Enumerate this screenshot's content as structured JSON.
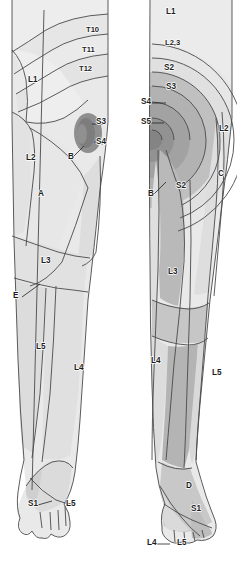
{
  "figure": {
    "views": [
      {
        "id": "left",
        "name": "anterior-medial-lower-limb"
      },
      {
        "id": "right",
        "name": "posterior-lateral-lower-limb"
      }
    ]
  },
  "colors": {
    "background": "#ffffff",
    "outline": "#3a3a3a",
    "skin_lightest": "#efefef",
    "skin_light": "#e4e4e4",
    "skin_mid": "#d2d2d2",
    "skin_mid2": "#c3c3c3",
    "skin_dark": "#b0b0b0",
    "skin_darker": "#9b9b9b",
    "skin_darkest": "#8a8a8a",
    "label_text": "#1d1d1d"
  },
  "left_view": {
    "name": "anterior-medial-lower-limb",
    "labels": [
      {
        "id": "t10",
        "text": "T10",
        "x": 86,
        "y": 32
      },
      {
        "id": "t11",
        "text": "T11",
        "x": 82,
        "y": 52
      },
      {
        "id": "t12",
        "text": "T12",
        "x": 79,
        "y": 71
      },
      {
        "id": "l1",
        "text": "L1",
        "x": 28,
        "y": 82
      },
      {
        "id": "s3",
        "text": "S3",
        "x": 96,
        "y": 124
      },
      {
        "id": "s4",
        "text": "S4",
        "x": 96,
        "y": 144
      },
      {
        "id": "l2",
        "text": "L2",
        "x": 26,
        "y": 160
      },
      {
        "id": "b",
        "text": "B",
        "x": 68,
        "y": 159
      },
      {
        "id": "a",
        "text": "A",
        "x": 38,
        "y": 196
      },
      {
        "id": "l3",
        "text": "L3",
        "x": 41,
        "y": 263
      },
      {
        "id": "e",
        "text": "E",
        "x": 13,
        "y": 298
      },
      {
        "id": "l5",
        "text": "L5",
        "x": 36,
        "y": 349
      },
      {
        "id": "l4",
        "text": "L4",
        "x": 74,
        "y": 370
      },
      {
        "id": "s1",
        "text": "S1",
        "x": 28,
        "y": 506
      },
      {
        "id": "l5b",
        "text": "L5",
        "x": 66,
        "y": 506
      }
    ]
  },
  "right_view": {
    "name": "posterior-lateral-lower-limb",
    "labels": [
      {
        "id": "l1",
        "text": "L1",
        "x": 166,
        "y": 14
      },
      {
        "id": "l23",
        "text": "L2,3",
        "x": 165,
        "y": 45
      },
      {
        "id": "s2",
        "text": "S2",
        "x": 164,
        "y": 70
      },
      {
        "id": "s3",
        "text": "S3",
        "x": 166,
        "y": 89
      },
      {
        "id": "s4",
        "text": "S4",
        "x": 141,
        "y": 104
      },
      {
        "id": "s5",
        "text": "S5",
        "x": 141,
        "y": 124
      },
      {
        "id": "l2",
        "text": "L2",
        "x": 219,
        "y": 131
      },
      {
        "id": "c",
        "text": "C",
        "x": 218,
        "y": 176
      },
      {
        "id": "s2b",
        "text": "S2",
        "x": 176,
        "y": 188
      },
      {
        "id": "b",
        "text": "B",
        "x": 148,
        "y": 196
      },
      {
        "id": "l3",
        "text": "L3",
        "x": 168,
        "y": 274
      },
      {
        "id": "l4",
        "text": "L4",
        "x": 151,
        "y": 363
      },
      {
        "id": "l5",
        "text": "L5",
        "x": 212,
        "y": 375
      },
      {
        "id": "d",
        "text": "D",
        "x": 186,
        "y": 488
      },
      {
        "id": "s1",
        "text": "S1",
        "x": 191,
        "y": 511
      },
      {
        "id": "l4b",
        "text": "L4",
        "x": 147,
        "y": 545
      },
      {
        "id": "l5b",
        "text": "L5",
        "x": 177,
        "y": 545
      }
    ]
  },
  "chart_data": {
    "type": "diagram",
    "dermatome_segments": [
      "T10",
      "T11",
      "T12",
      "L1",
      "L2",
      "L3",
      "L4",
      "L5",
      "S1",
      "S2",
      "S3",
      "S4",
      "S5"
    ],
    "lettered_regions": [
      "A",
      "B",
      "C",
      "D",
      "E"
    ],
    "views": 2
  }
}
